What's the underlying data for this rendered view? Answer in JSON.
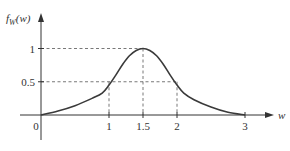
{
  "chart_data": {
    "type": "line",
    "title": "",
    "xlabel": "w",
    "ylabel": "f_W(w)",
    "ylabel_main": "f",
    "ylabel_sub": "W",
    "ylabel_arg": "(w)",
    "xlim": [
      0,
      3.4
    ],
    "ylim": [
      0,
      1.1
    ],
    "x_ticks": [
      {
        "value": 0,
        "label": "0"
      },
      {
        "value": 1,
        "label": "1"
      },
      {
        "value": 1.5,
        "label": "1.5"
      },
      {
        "value": 2,
        "label": "2"
      },
      {
        "value": 3,
        "label": "3"
      }
    ],
    "y_ticks": [
      {
        "value": 0.5,
        "label": "0.5"
      },
      {
        "value": 1,
        "label": "1"
      }
    ],
    "guides": [
      {
        "from": [
          0,
          1
        ],
        "to": [
          1.5,
          1
        ]
      },
      {
        "from": [
          1.5,
          1
        ],
        "to": [
          1.5,
          0
        ]
      },
      {
        "from": [
          0,
          0.5
        ],
        "to": [
          2,
          0.5
        ]
      },
      {
        "from": [
          1,
          0.5
        ],
        "to": [
          1,
          0
        ]
      },
      {
        "from": [
          2,
          0.5
        ],
        "to": [
          2,
          0
        ]
      }
    ],
    "series": [
      {
        "name": "f_W(w)",
        "x": [
          0,
          0.25,
          0.5,
          0.75,
          0.9,
          1.0,
          1.1,
          1.2,
          1.3,
          1.4,
          1.5,
          1.6,
          1.7,
          1.8,
          1.9,
          2.0,
          2.1,
          2.25,
          2.5,
          2.75,
          3.0
        ],
        "y": [
          0,
          0.06,
          0.14,
          0.25,
          0.33,
          0.45,
          0.6,
          0.76,
          0.89,
          0.97,
          1.0,
          0.97,
          0.89,
          0.76,
          0.6,
          0.45,
          0.33,
          0.23,
          0.12,
          0.04,
          0
        ]
      }
    ],
    "grid": false,
    "legend": "none"
  }
}
